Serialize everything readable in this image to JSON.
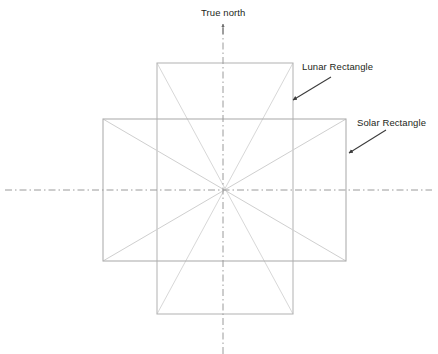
{
  "diagram": {
    "background_color": "#ffffff",
    "canvas": {
      "width": 438,
      "height": 354
    },
    "center": {
      "x": 223,
      "y": 190
    },
    "labels": {
      "true_north": "True north",
      "lunar_rectangle": "Lunar Rectangle",
      "solar_rectangle": "Solar Rectangle"
    },
    "colors": {
      "rectangle_stroke": "#b4b4b4",
      "diagonal_stroke": "#d5d5d5",
      "axis_stroke": "#9a9a9a",
      "arrow_stroke": "#3b3b3b",
      "text": "#231f20"
    },
    "shapes": {
      "lunar_rectangle": {
        "name": "Lunar Rectangle",
        "x1": 157,
        "y1": 63,
        "x2": 293,
        "y2": 314,
        "width": 136,
        "height": 251,
        "orientation": "portrait (tall north-south)"
      },
      "solar_rectangle": {
        "name": "Solar Rectangle",
        "x1": 103,
        "y1": 119,
        "x2": 346,
        "y2": 261,
        "width": 243,
        "height": 142,
        "orientation": "landscape (wide east-west)"
      }
    },
    "axes": {
      "vertical": {
        "name": "True north axis",
        "x": 223,
        "y_top": 23,
        "y_bottom": 354,
        "style": "dash-dot",
        "has_arrowhead_at_top": true
      },
      "horizontal": {
        "name": "East-west axis",
        "y": 190,
        "x_left": 5,
        "x_right": 432,
        "style": "dash-dot",
        "has_arrowhead_at_top": false
      }
    },
    "annotations": [
      {
        "id": "lunar",
        "text": "Lunar Rectangle",
        "label_x": 302,
        "label_y": 61,
        "arrow_from": {
          "x": 331,
          "y": 77
        },
        "arrow_to": {
          "x": 292,
          "y": 101
        }
      },
      {
        "id": "solar",
        "text": "Solar Rectangle",
        "label_x": 357,
        "label_y": 117,
        "arrow_from": {
          "x": 386,
          "y": 130
        },
        "arrow_to": {
          "x": 348,
          "y": 154
        }
      }
    ]
  }
}
